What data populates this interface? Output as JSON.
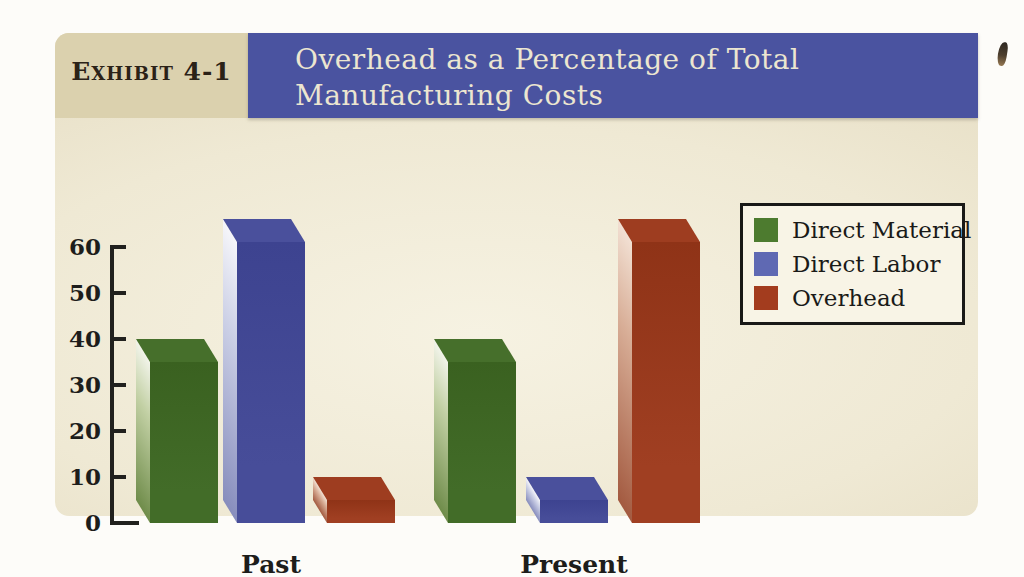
{
  "exhibit": {
    "label": "Exhibit 4-1",
    "title_line1": "Overhead as a Percentage of Total",
    "title_line2": "Manufacturing Costs"
  },
  "chart_data": {
    "type": "bar",
    "style": "3d",
    "title": "Overhead as a Percentage of Total Manufacturing Costs",
    "categories": [
      "Past",
      "Present"
    ],
    "series": [
      {
        "name": "Direct Material",
        "values": [
          35,
          35
        ]
      },
      {
        "name": "Direct Labor",
        "values": [
          61,
          5
        ]
      },
      {
        "name": "Overhead",
        "values": [
          5,
          61
        ]
      }
    ],
    "xlabel": "",
    "ylabel": "",
    "ylim": [
      0,
      60
    ],
    "yticks": [
      60,
      50,
      40,
      30,
      20,
      10,
      0
    ],
    "grid": false,
    "legend_position": "right"
  },
  "colors": {
    "banner_bg": "#4a53a0",
    "banner_text": "#ece6d0",
    "exhibit_box_bg": "#dbd1ae",
    "exhibit_text": "#2b2217",
    "panel_center": "#f6f2e2",
    "panel_edge": "#ddd3b4",
    "axis": "#21211e",
    "legend_border": "#191917",
    "legend_bg": "#f8f4e6",
    "series": [
      {
        "front": "#426c28",
        "front_dark": "#3a6120",
        "top": "#466f2b",
        "side_light": "#f2f4ea",
        "side_mid": "#c2d0a4",
        "side_dark": "#6f8c4a",
        "legend": "#4d7b2f"
      },
      {
        "front": "#474d99",
        "front_dark": "#3d4390",
        "top": "#4a509c",
        "side_light": "#f6f6fa",
        "side_mid": "#ccd0e6",
        "side_dark": "#878dbd",
        "legend": "#5f69b3"
      },
      {
        "front": "#a03f22",
        "front_dark": "#8f3317",
        "top": "#9e3d20",
        "side_light": "#f2e0d3",
        "side_mid": "#d8ae97",
        "side_dark": "#a35a40",
        "legend": "#a33c1e"
      }
    ]
  }
}
